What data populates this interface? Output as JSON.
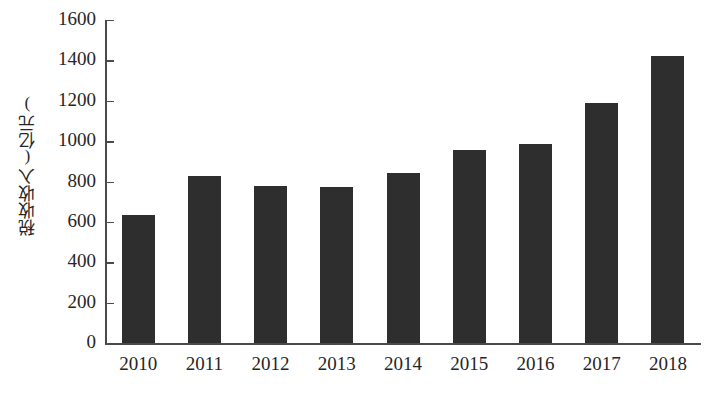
{
  "chart_data": {
    "type": "bar",
    "title": "",
    "subtitle": "",
    "xlabel": "",
    "ylabel": "税收收入(亿元)",
    "categories": [
      "2010",
      "2011",
      "2012",
      "2013",
      "2014",
      "2015",
      "2016",
      "2017",
      "2018"
    ],
    "values": [
      634,
      825,
      780,
      775,
      840,
      958,
      988,
      1190,
      1424
    ],
    "series": [
      {
        "name": "税收收入",
        "values": [
          634,
          825,
          780,
          775,
          840,
          958,
          988,
          1190,
          1424
        ]
      }
    ],
    "ylim": [
      0,
      1600
    ],
    "ytick_values": [
      0,
      200,
      400,
      600,
      800,
      1000,
      1200,
      1400,
      1600
    ],
    "ytick_labels": [
      "0",
      "200",
      "400",
      "600",
      "800",
      "1000",
      "1200",
      "1400",
      "1600"
    ],
    "grid": false,
    "legend": false,
    "legend_position": "none",
    "bar_color": "#2e2e2e",
    "axis_color": "#4a4a4a",
    "background_color": "#ffffff",
    "text_color": "#262626"
  }
}
